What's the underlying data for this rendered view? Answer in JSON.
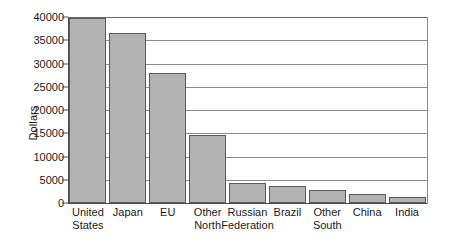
{
  "chart_data": {
    "type": "bar",
    "title": "",
    "xlabel": "",
    "ylabel": "Dollars",
    "ylim": [
      0,
      40000
    ],
    "yticks": [
      0,
      5000,
      10000,
      15000,
      20000,
      25000,
      30000,
      35000,
      40000
    ],
    "ytick_labels": [
      "0",
      "5000",
      "10000",
      "15000",
      "20000",
      "25000",
      "30000",
      "35000",
      "40000"
    ],
    "grid": true,
    "legend": false,
    "categories": [
      "United States",
      "Japan",
      "EU",
      "Other North",
      "Russian Federation",
      "Brazil",
      "Other South",
      "China",
      "India"
    ],
    "category_labels": [
      "United\nStates",
      "Japan",
      "EU",
      "Other\nNorth",
      "Russian\nFederation",
      "Brazil",
      "Other\nSouth",
      "China",
      "India"
    ],
    "values": [
      39800,
      36500,
      28000,
      14700,
      4400,
      3600,
      2800,
      2000,
      1300
    ],
    "bar_color": "#b3b3b3",
    "bar_edge_color": "#5a5a5a",
    "grid_color": "#8c8c8c",
    "axis_color": "#4d4d4d",
    "background": "#ffffff"
  }
}
